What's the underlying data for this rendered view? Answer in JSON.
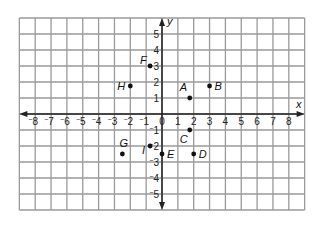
{
  "figure": {
    "x_axis_label": "x",
    "y_axis_label": "y"
  },
  "chart_data": {
    "type": "scatter",
    "title": "",
    "xlabel": "x",
    "ylabel": "y",
    "xlim": [
      -9,
      9
    ],
    "ylim": [
      -6,
      6
    ],
    "grid": true,
    "x_ticks": [
      -8,
      -7,
      -6,
      -5,
      -4,
      -3,
      -2,
      -1,
      0,
      1,
      2,
      3,
      4,
      5,
      6,
      7,
      8
    ],
    "y_ticks": [
      -5,
      -4,
      -3,
      -2,
      -1,
      1,
      2,
      3,
      4,
      5
    ],
    "x_tick_labels": [
      "-8",
      "-7",
      "-6",
      "-5",
      "-4",
      "-3",
      "-2",
      "-1",
      "0",
      "1",
      "2",
      "3",
      "4",
      "5",
      "6",
      "7",
      "8"
    ],
    "y_tick_labels": [
      "-5",
      "-4",
      "-3",
      "-2",
      "-1",
      "1",
      "2",
      "3",
      "4",
      "5"
    ],
    "points": [
      {
        "label": "A",
        "x": 1.75,
        "y": 1,
        "label_dx": -10,
        "label_dy": -7
      },
      {
        "label": "B",
        "x": 3,
        "y": 1.75,
        "label_dx": 5,
        "label_dy": 4
      },
      {
        "label": "C",
        "x": 1.75,
        "y": -1,
        "label_dx": -10,
        "label_dy": 13
      },
      {
        "label": "D",
        "x": 2,
        "y": -2.5,
        "label_dx": 5,
        "label_dy": 4
      },
      {
        "label": "E",
        "x": 0,
        "y": -2.5,
        "label_dx": 5,
        "label_dy": 4
      },
      {
        "label": "F",
        "x": -0.75,
        "y": 3,
        "label_dx": -10,
        "label_dy": -2
      },
      {
        "label": "G",
        "x": -2.5,
        "y": -2.5,
        "label_dx": -3,
        "label_dy": -7
      },
      {
        "label": "H",
        "x": -2,
        "y": 1.75,
        "label_dx": -13,
        "label_dy": 4
      },
      {
        "label": "I",
        "x": -0.75,
        "y": -2,
        "label_dx": -8,
        "label_dy": 8
      }
    ]
  },
  "colors": {
    "grid": "#9a9a9a",
    "axis": "#222222",
    "point": "#111111",
    "background": "#ffffff"
  }
}
